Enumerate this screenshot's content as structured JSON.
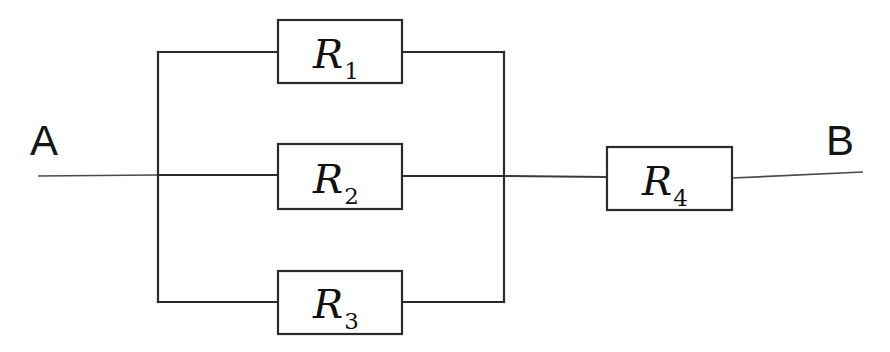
{
  "diagram": {
    "background_color": "#ffffff",
    "line_color": "#2b2b2b",
    "label_color": "#111111",
    "width": 890,
    "height": 352,
    "terminals": [
      {
        "id": "A",
        "label": "A",
        "label_x": 30,
        "label_y": 155,
        "side": "left"
      },
      {
        "id": "B",
        "label": "B",
        "label_x": 826,
        "label_y": 155,
        "side": "right"
      }
    ],
    "resistors": [
      {
        "id": "R1",
        "base": "R",
        "subscript": "1",
        "x": 278,
        "y": 20,
        "width": 124,
        "height": 63,
        "rail_y": 52,
        "branch": "parallel-top"
      },
      {
        "id": "R2",
        "base": "R",
        "subscript": "2",
        "x": 278,
        "y": 144,
        "width": 124,
        "height": 65,
        "rail_y": 175,
        "branch": "parallel-middle"
      },
      {
        "id": "R3",
        "base": "R",
        "subscript": "3",
        "x": 278,
        "y": 271,
        "width": 124,
        "height": 63,
        "rail_y": 302,
        "branch": "parallel-bottom"
      },
      {
        "id": "R4",
        "base": "R",
        "subscript": "4",
        "x": 607,
        "y": 147,
        "width": 125,
        "height": 63,
        "rail_y": 175,
        "branch": "series"
      }
    ],
    "nodes": [
      {
        "id": "left-bus",
        "x": 158,
        "y_top": 52,
        "y_bottom": 302
      },
      {
        "id": "right-bus",
        "x": 504,
        "y_top": 52,
        "y_bottom": 302
      }
    ],
    "wires": [
      {
        "id": "lead-a",
        "d": "M 38 176 L 158 175"
      },
      {
        "id": "left-bus-vertical",
        "d": "M 158 52 L 158 302"
      },
      {
        "id": "top-left-rail",
        "d": "M 158 52 L 278 52"
      },
      {
        "id": "top-right-rail",
        "d": "M 402 52 L 504 52"
      },
      {
        "id": "middle-left-rail",
        "d": "M 158 175 L 278 175"
      },
      {
        "id": "middle-right-rail",
        "d": "M 402 176 L 504 176"
      },
      {
        "id": "bottom-left-rail",
        "d": "M 158 302 L 278 302"
      },
      {
        "id": "bottom-right-rail",
        "d": "M 402 302 L 504 302"
      },
      {
        "id": "right-bus-vertical",
        "d": "M 504 52 L 504 302"
      },
      {
        "id": "series-link",
        "d": "M 504 176 L 607 177"
      },
      {
        "id": "lead-b",
        "d": "M 732 178 L 863 172"
      }
    ]
  }
}
